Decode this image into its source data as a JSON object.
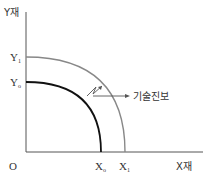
{
  "diagram": {
    "type": "production-possibility-frontier-shift",
    "labels": {
      "y_axis": "Y재",
      "x_axis": "X재",
      "origin": "O",
      "y1_main": "Y",
      "y1_sub": "1",
      "y0_main": "Y",
      "y0_sub": "o",
      "x0_main": "X",
      "x0_sub": "o",
      "x1_main": "X",
      "x1_sub": "1",
      "annotation": "기술진보"
    },
    "colors": {
      "axis": "#555555",
      "ppf_original": "#111111",
      "ppf_shifted": "#888888",
      "text": "#333333"
    }
  }
}
